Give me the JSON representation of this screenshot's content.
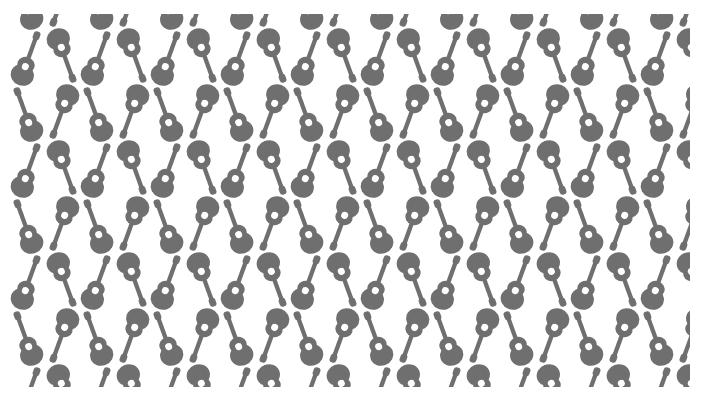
{
  "image": {
    "description": "Seamless wallpaper pattern of acoustic guitar silhouettes",
    "background_color": "#ffffff",
    "motif_color": "#6f6f6f",
    "motif": "acoustic-guitar-icon",
    "tile": {
      "width": 70,
      "height": 112
    },
    "area": {
      "x": 0,
      "y": 14,
      "width": 690,
      "height": 373
    },
    "columns_per_tile": 2,
    "rows_per_tile": 2,
    "arrangement": [
      {
        "row": 0,
        "col": 0,
        "orientation": "upright",
        "tilt_deg": -20
      },
      {
        "row": 0,
        "col": 1,
        "orientation": "inverted",
        "tilt_deg": 200
      },
      {
        "row": 1,
        "col": 0,
        "orientation": "upright",
        "tilt_deg": 20
      },
      {
        "row": 1,
        "col": 1,
        "orientation": "inverted",
        "tilt_deg": 160
      }
    ]
  }
}
